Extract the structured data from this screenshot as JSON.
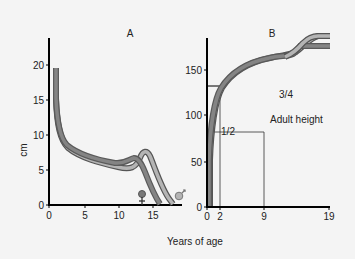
{
  "chart_data": [
    {
      "panel": "A",
      "type": "line",
      "title": "A",
      "xlabel": "Years of age",
      "ylabel": "cm",
      "xlim": [
        0,
        19
      ],
      "ylim": [
        0,
        23
      ],
      "xticks": [
        "0",
        "5",
        "10",
        "15"
      ],
      "yticks": [
        "0",
        "5",
        "10",
        "15",
        "20"
      ],
      "grid": false,
      "series": [
        {
          "name": "Girls (height velocity)",
          "color": "#777777",
          "x": [
            0.5,
            1,
            2,
            3,
            5,
            8,
            10,
            11.5,
            12,
            13,
            14,
            15,
            16
          ],
          "y": [
            19.5,
            12,
            8.5,
            7.2,
            6.3,
            5.8,
            5.7,
            6.2,
            6.4,
            6.0,
            3.5,
            1.0,
            0
          ]
        },
        {
          "name": "Boys (height velocity)",
          "color": "#b0b0b0",
          "x": [
            0.5,
            1,
            2,
            3,
            5,
            8,
            10,
            12,
            13,
            13.5,
            14,
            15,
            16,
            17,
            18
          ],
          "y": [
            19.0,
            11.5,
            8.0,
            6.8,
            6.0,
            5.5,
            5.2,
            5.3,
            6.5,
            7.2,
            7.0,
            5.0,
            2.5,
            0.8,
            0
          ]
        }
      ],
      "annotations": [
        {
          "symbol": "female",
          "x": 13.2,
          "y": 1.5
        },
        {
          "symbol": "male",
          "x": 18.5,
          "y": 1.5
        }
      ]
    },
    {
      "panel": "B",
      "type": "line",
      "title": "B",
      "xlabel": "Years of age",
      "ylabel": "",
      "xlim": [
        0,
        19
      ],
      "ylim": [
        0,
        185
      ],
      "xticks": [
        "0",
        "2",
        "9",
        "19"
      ],
      "yticks": [
        "0",
        "50",
        "100",
        "150"
      ],
      "grid": false,
      "series": [
        {
          "name": "Girls (height)",
          "color": "#777777",
          "x": [
            0,
            0.5,
            1,
            2,
            4,
            6,
            9,
            11,
            12,
            13,
            15,
            19
          ],
          "y": [
            50,
            68,
            75,
            86,
            102,
            115,
            133,
            145,
            152,
            160,
            162,
            162
          ]
        },
        {
          "name": "Boys (height)",
          "color": "#b0b0b0",
          "x": [
            0,
            0.5,
            1,
            2,
            4,
            6,
            9,
            11,
            12,
            13,
            14,
            15,
            16,
            19
          ],
          "y": [
            50,
            70,
            76,
            87,
            103,
            116,
            133,
            142,
            148,
            160,
            168,
            172,
            174,
            174
          ]
        }
      ],
      "reference_lines": [
        {
          "label": "1/2",
          "x": 2,
          "y": 86
        },
        {
          "label": "3/4",
          "x": 9,
          "y": 133
        }
      ],
      "annotations": [
        {
          "text": "1/2"
        },
        {
          "text": "3/4"
        },
        {
          "text": "Adult height"
        }
      ]
    }
  ],
  "labels": {
    "panel_a": "A",
    "panel_b": "B",
    "ylabel_a": "cm",
    "xlabel": "Years of age",
    "half": "1/2",
    "three_quarter": "3/4",
    "adult_height": "Adult height",
    "a_xticks": [
      "0",
      "5",
      "10",
      "15"
    ],
    "a_yticks": [
      "0",
      "5",
      "10",
      "15",
      "20"
    ],
    "b_xticks": [
      "0",
      "2",
      "9",
      "19"
    ],
    "b_yticks": [
      "0",
      "50",
      "100",
      "150"
    ]
  }
}
